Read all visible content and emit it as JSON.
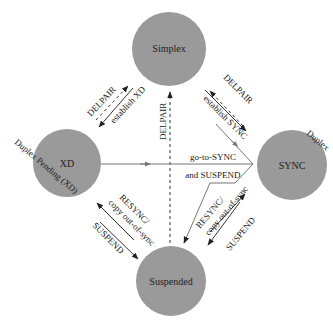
{
  "colors": {
    "node_fill": "#9a9a9a",
    "line": "#333333",
    "line_light": "#777777",
    "text": "#222222",
    "background": "#ffffff"
  },
  "nodes": {
    "simplex": {
      "label": "Simplex"
    },
    "xd": {
      "label": "XD",
      "annotation": "Duplex Pending (XD)"
    },
    "sync": {
      "label": "SYNC",
      "annotation": "Duplex"
    },
    "suspended": {
      "label": "Suspended"
    }
  },
  "edges": {
    "simplex_xd_delpair": "DELPAIR",
    "simplex_xd_establish": "establish XD",
    "simplex_sync_delpair": "DELPAIR",
    "simplex_sync_establish": "establish SYNC",
    "center_delpair": "DELPAIR",
    "goto_sync_line1": "go-to-SYNC",
    "goto_sync_line2": "and SUSPEND",
    "xd_suspended_resync_line1": "RESYNC/",
    "xd_suspended_resync_line2": "copy out-of-sync",
    "xd_suspended_suspend": "SUSPEND",
    "sync_suspended_resync_line1": "RESYNC/",
    "sync_suspended_resync_line2": "copy out-of-sync",
    "sync_suspended_suspend": "SUSPEND"
  }
}
